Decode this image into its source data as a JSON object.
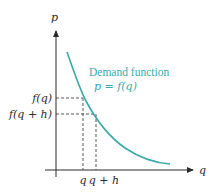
{
  "diagram": {
    "title": "Demand function",
    "curve_label": "p = f(q)",
    "axes": {
      "y_label": "p",
      "x_label": "q"
    },
    "y_markers": [
      "f(q)",
      "f(q + h)"
    ],
    "x_markers": [
      "q",
      "q + h"
    ],
    "colors": {
      "curve": "#3aa9a9",
      "axis": "#2a2a2a",
      "dashed": "#444444"
    }
  }
}
